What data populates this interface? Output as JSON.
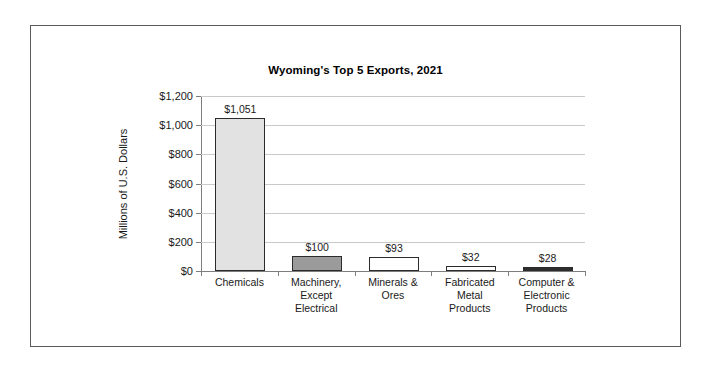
{
  "figure": {
    "border_color": "#5a5a5a",
    "background": "#ffffff"
  },
  "chart_data": {
    "type": "bar",
    "title": "Wyoming's Top 5 Exports, 2021",
    "xlabel": "",
    "ylabel": "Millions of U.S. Dollars",
    "categories": [
      "Chemicals",
      "Machinery, Except Electrical",
      "Minerals & Ores",
      "Fabricated Metal Products",
      "Computer & Electronic Products"
    ],
    "category_lines": [
      [
        "Chemicals"
      ],
      [
        "Machinery,",
        "Except",
        "Electrical"
      ],
      [
        "Minerals &",
        "Ores"
      ],
      [
        "Fabricated",
        "Metal",
        "Products"
      ],
      [
        "Computer &",
        "Electronic",
        "Products"
      ]
    ],
    "values": [
      1051,
      100,
      93,
      32,
      28
    ],
    "data_labels": [
      "$1,051",
      "$100",
      "$93",
      "$32",
      "$28"
    ],
    "bar_colors": [
      "#e2e2e2",
      "#9b9b9b",
      "#ffffff",
      "#fcfcfc",
      "#2e2e2e"
    ],
    "bar_border_color": "#2b2b2b",
    "ylim": [
      0,
      1200
    ],
    "yticks": [
      0,
      200,
      400,
      600,
      800,
      1000,
      1200
    ],
    "ytick_labels": [
      "$0",
      "$200",
      "$400",
      "$600",
      "$800",
      "$1,000",
      "$1,200"
    ],
    "grid": true,
    "grid_color": "#c9c9c9",
    "axis_color": "#7d7d7d",
    "legend": false
  }
}
